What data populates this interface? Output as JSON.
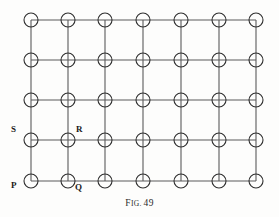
{
  "figure": {
    "caption_prefix_large": "F",
    "caption_prefix_small": "IG.",
    "caption_number": "49",
    "caption_full": "Fig. 49",
    "grid": {
      "columns": 7,
      "rows": 5,
      "column_centers_x": [
        31,
        68,
        105,
        143,
        181,
        219,
        256
      ],
      "row_centers_y": [
        20,
        60,
        100,
        140,
        181
      ],
      "node_radius": 7,
      "node_count": 35,
      "edge_color": "#5a5a5a",
      "node_stroke_color": "#2e2e2e",
      "node_fill_color": "#ffffff",
      "edge_width": 1.1,
      "node_stroke_width": 1.1
    },
    "labels": [
      {
        "text": "P",
        "x": 11,
        "y": 181,
        "node_col": 0,
        "node_row": 4,
        "anchor": "lower-left"
      },
      {
        "text": "Q",
        "x": 75,
        "y": 183,
        "node_col": 1,
        "node_row": 4,
        "anchor": "lower-right"
      },
      {
        "text": "R",
        "x": 76,
        "y": 125,
        "node_col": 1,
        "node_row": 3,
        "anchor": "upper-right"
      },
      {
        "text": "S",
        "x": 11,
        "y": 125,
        "node_col": 0,
        "node_row": 3,
        "anchor": "upper-left"
      }
    ]
  }
}
